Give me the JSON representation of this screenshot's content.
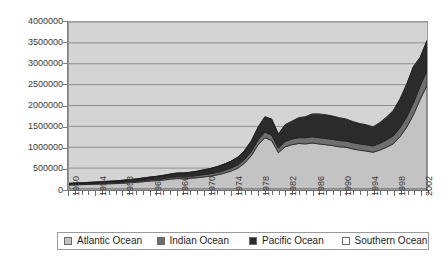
{
  "chart_data": {
    "type": "area",
    "stacked": true,
    "title": "",
    "subtitle": "",
    "xlabel": "",
    "ylabel": "",
    "xlim": [
      1950,
      2003
    ],
    "ylim": [
      0,
      4000000
    ],
    "grid": true,
    "legend_position": "bottom",
    "y_ticks": [
      0,
      500000,
      1000000,
      1500000,
      2000000,
      2500000,
      3000000,
      3500000,
      4000000
    ],
    "y_tick_labels": [
      "0",
      "500000",
      "1000000",
      "1500000",
      "2000000",
      "2500000",
      "3000000",
      "3500000",
      "4000000"
    ],
    "x_tick_labels": [
      "1950",
      "1954",
      "1958",
      "1962",
      "1966",
      "1970",
      "1974",
      "1978",
      "1982",
      "1986",
      "1990",
      "1994",
      "1998",
      "2002"
    ],
    "x": [
      1950,
      1951,
      1952,
      1953,
      1954,
      1955,
      1956,
      1957,
      1958,
      1959,
      1960,
      1961,
      1962,
      1963,
      1964,
      1965,
      1966,
      1967,
      1968,
      1969,
      1970,
      1971,
      1972,
      1973,
      1974,
      1975,
      1976,
      1977,
      1978,
      1979,
      1980,
      1981,
      1982,
      1983,
      1984,
      1985,
      1986,
      1987,
      1988,
      1989,
      1990,
      1991,
      1992,
      1993,
      1994,
      1995,
      1996,
      1997,
      1998,
      1999,
      2000,
      2001,
      2002,
      2003
    ],
    "series": [
      {
        "name": "Atlantic Ocean",
        "color": "#c3c3c3",
        "values": [
          95000,
          100000,
          105000,
          110000,
          115000,
          120000,
          125000,
          130000,
          140000,
          150000,
          160000,
          175000,
          190000,
          200000,
          215000,
          235000,
          250000,
          245000,
          255000,
          270000,
          290000,
          310000,
          340000,
          380000,
          430000,
          500000,
          620000,
          800000,
          1060000,
          1230000,
          1160000,
          870000,
          1010000,
          1060000,
          1090000,
          1080000,
          1100000,
          1080000,
          1060000,
          1040000,
          1010000,
          1000000,
          960000,
          930000,
          910000,
          880000,
          930000,
          1000000,
          1080000,
          1250000,
          1480000,
          1780000,
          2150000,
          2480000
        ]
      },
      {
        "name": "Indian Ocean",
        "color": "#6e6e6e",
        "values": [
          15000,
          16000,
          17000,
          18000,
          19000,
          20000,
          22000,
          23000,
          25000,
          27000,
          29000,
          31000,
          33000,
          35000,
          38000,
          41000,
          44000,
          46000,
          48000,
          51000,
          55000,
          58000,
          62000,
          66000,
          70000,
          78000,
          88000,
          100000,
          120000,
          135000,
          130000,
          110000,
          125000,
          135000,
          140000,
          145000,
          150000,
          150000,
          150000,
          150000,
          150000,
          150000,
          150000,
          150000,
          150000,
          150000,
          160000,
          175000,
          190000,
          215000,
          245000,
          280000,
          320000,
          360000
        ]
      },
      {
        "name": "Pacific Ocean",
        "color": "#2b2b2b",
        "values": [
          25000,
          27000,
          29000,
          31000,
          33000,
          36000,
          39000,
          42000,
          45000,
          49000,
          53000,
          58000,
          63000,
          68000,
          74000,
          81000,
          88000,
          92000,
          98000,
          106000,
          115000,
          125000,
          137000,
          150000,
          165000,
          185000,
          215000,
          250000,
          300000,
          360000,
          380000,
          330000,
          400000,
          420000,
          470000,
          500000,
          540000,
          560000,
          560000,
          550000,
          540000,
          520000,
          500000,
          480000,
          470000,
          450000,
          490000,
          540000,
          600000,
          680000,
          780000,
          870000,
          680000,
          710000
        ]
      },
      {
        "name": "Southern Ocean",
        "color": "#ffffff",
        "values": [
          0,
          0,
          0,
          0,
          0,
          0,
          0,
          0,
          0,
          0,
          0,
          0,
          0,
          0,
          0,
          0,
          0,
          0,
          0,
          0,
          0,
          0,
          0,
          0,
          1000,
          2000,
          3000,
          4000,
          6000,
          8000,
          9000,
          8000,
          9000,
          10000,
          10000,
          10000,
          10000,
          10000,
          10000,
          10000,
          10000,
          10000,
          10000,
          10000,
          10000,
          10000,
          10000,
          10000,
          10000,
          10000,
          10000,
          10000,
          10000,
          10000
        ]
      }
    ]
  },
  "legend": {
    "items": [
      {
        "label": "Atlantic Ocean",
        "swatch": "#c3c3c3"
      },
      {
        "label": "Indian Ocean",
        "swatch": "#6e6e6e"
      },
      {
        "label": "Pacific Ocean",
        "swatch": "#2b2b2b"
      },
      {
        "label": "Southern Ocean",
        "swatch": "#ffffff"
      }
    ]
  },
  "colors": {
    "plot_background": "#d4d4d4",
    "gridline": "#8e8e8e",
    "axis": "#6f6f6f",
    "text": "#3a3a3a"
  }
}
